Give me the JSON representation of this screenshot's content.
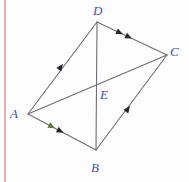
{
  "figure": {
    "background_color": "#fdfdfd",
    "margin_rule_color": "#e9acac",
    "line_color": "#6e6e78",
    "label_color": "#4a4ab4",
    "tick_green_color": "#4a7a32"
  },
  "vertices": {
    "A": {
      "label": "A",
      "x": 28,
      "y": 114
    },
    "B": {
      "label": "B",
      "x": 96,
      "y": 150
    },
    "C": {
      "label": "C",
      "x": 167,
      "y": 55
    },
    "D": {
      "label": "D",
      "x": 97,
      "y": 22
    },
    "E": {
      "label": "E",
      "x": 97,
      "y": 88
    }
  },
  "segments": [
    {
      "name": "A-D",
      "from": "A",
      "to": "D",
      "arrow_marks": 1,
      "arrow_direction": "A-to-D"
    },
    {
      "name": "D-C",
      "from": "D",
      "to": "C",
      "arrow_marks": 2,
      "arrow_direction": "D-to-C"
    },
    {
      "name": "A-B",
      "from": "A",
      "to": "B",
      "arrow_marks": 2,
      "arrow_direction": "A-to-B"
    },
    {
      "name": "B-C",
      "from": "B",
      "to": "C",
      "arrow_marks": 1,
      "arrow_direction": "B-to-C"
    },
    {
      "name": "A-C",
      "from": "A",
      "to": "C",
      "arrow_marks": 0,
      "arrow_direction": "none"
    },
    {
      "name": "D-B",
      "from": "D",
      "to": "B",
      "arrow_marks": 0,
      "arrow_direction": "none"
    }
  ],
  "labels": {
    "D": "D",
    "C": "C",
    "E": "E",
    "A": "A",
    "B": "B"
  }
}
